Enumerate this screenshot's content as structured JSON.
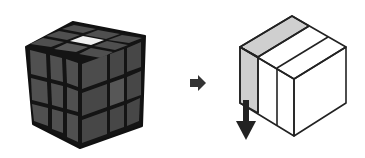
{
  "diagram": {
    "left_figure": {
      "name": "rubiks-cube",
      "grid": "3x3x3",
      "face_color": "#4a4a4a",
      "edge_color": "#111111",
      "highlight_sticker": {
        "face": "top",
        "position": "center-front",
        "color": "#f2f2f2"
      }
    },
    "transition_arrow": {
      "direction": "right",
      "color": "#333333"
    },
    "right_figure": {
      "name": "cube-slice-diagram",
      "slices": 3,
      "highlighted_slice": "left",
      "highlight_color": "#cfcfcf",
      "line_color": "#222222",
      "rotation_arrow": {
        "direction": "down",
        "color": "#222222"
      }
    }
  },
  "colors": {
    "background": "#ffffff"
  }
}
